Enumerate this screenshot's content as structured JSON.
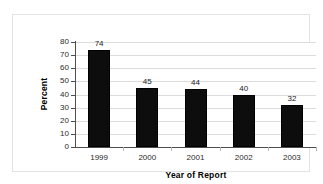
{
  "chart_data": {
    "type": "bar",
    "title": "",
    "subtitle": "",
    "xlabel": "Year of Report",
    "ylabel": "Percent",
    "categories": [
      "1999",
      "2000",
      "2001",
      "2002",
      "2003"
    ],
    "values": [
      74,
      45,
      44,
      40,
      32
    ],
    "data_labels": [
      "74",
      "45",
      "44",
      "40",
      "32"
    ],
    "ylim": [
      0,
      80
    ],
    "ytick_step": 10,
    "ytick_labels": [
      "80",
      "70",
      "60",
      "50",
      "40",
      "30",
      "20",
      "10",
      "0"
    ],
    "grid": "horizontal",
    "legend": "none",
    "series_color": "#0d0d0d",
    "gridline_color": "#dcdcdc",
    "axis_color": "#4d4d4d",
    "background": "#ffffff",
    "frame_color": "#e3e3e3"
  }
}
